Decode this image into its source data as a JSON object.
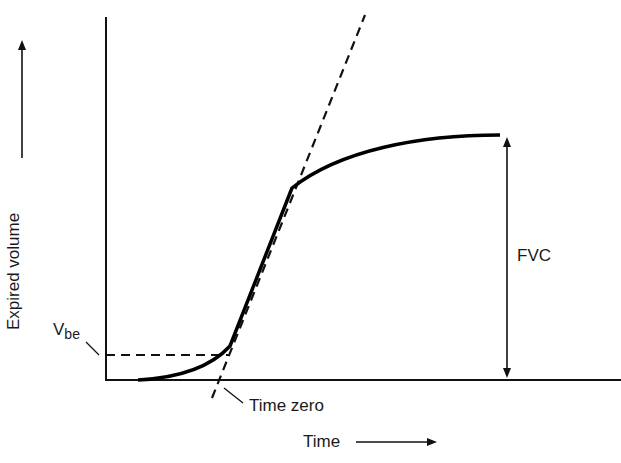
{
  "diagram": {
    "type": "spirometry volume-time curve",
    "y_axis_label": "Expired volume",
    "x_axis_label": "Time",
    "labels": {
      "vbe": "V",
      "vbe_sub": "be",
      "fvc": "FVC",
      "time_zero": "Time zero"
    },
    "elements": [
      "expired volume curve",
      "back-extrapolation tangent (dashed)",
      "Vbe horizontal dashed line",
      "FVC double arrow"
    ]
  }
}
